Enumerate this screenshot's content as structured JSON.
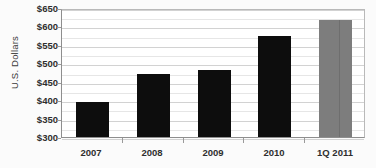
{
  "chart_data": {
    "type": "bar",
    "title": "",
    "subtitle": "",
    "xlabel": "",
    "ylabel": "U.S. Dollars",
    "categories": [
      "2007",
      "2008",
      "2009",
      "2010",
      "1Q 2011"
    ],
    "values": [
      395,
      470,
      482,
      575,
      617
    ],
    "value_prefix": "$",
    "ylim": [
      300,
      650
    ],
    "y_major_step": 50,
    "y_minor_step": 25,
    "y_tick_labels": [
      "$300",
      "$350",
      "$400",
      "$450",
      "$500",
      "$550",
      "$600",
      "$650"
    ],
    "y_tick_values": [
      300,
      350,
      400,
      450,
      500,
      550,
      600,
      650
    ],
    "grid": true,
    "grid_axis": "y",
    "legend": false,
    "legend_position": "none",
    "series": [
      {
        "name": "U.S. Dollars",
        "values": [
          395,
          470,
          482,
          575,
          617
        ],
        "bar_colors": [
          "#0d0d0d",
          "#0d0d0d",
          "#0d0d0d",
          "#0d0d0d",
          "#7d7d7d"
        ]
      }
    ],
    "colors": {
      "bar_primary": "#0d0d0d",
      "bar_highlight": "#7d7d7d",
      "gridline_major": "#d2d2d2",
      "gridline_minor": "#e6e6e6",
      "axis": "#8e8e8e",
      "plot_background": "#ffffff",
      "page_background": "#fbfbfb",
      "text": "#2e2e2e"
    }
  }
}
